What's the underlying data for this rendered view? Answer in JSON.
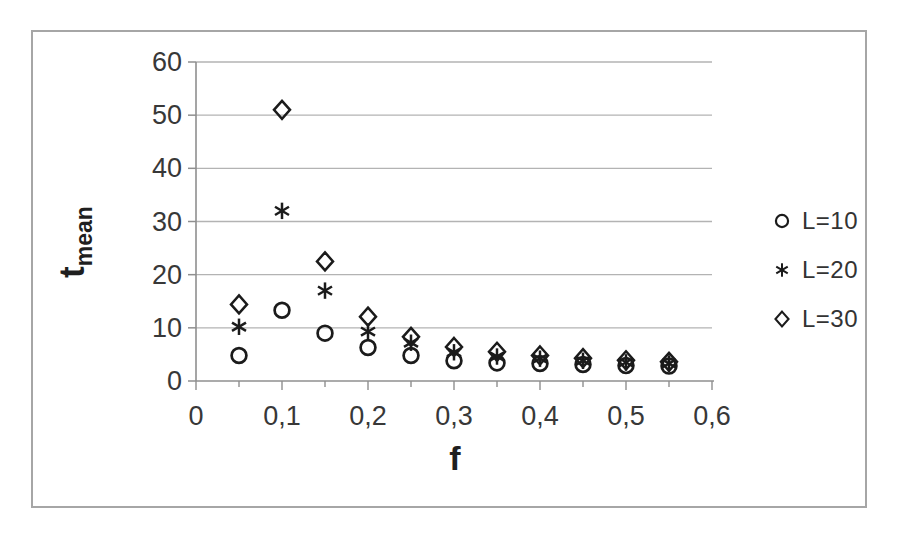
{
  "figure": {
    "background": "#ffffff",
    "border_color": "#a6a6a6"
  },
  "chart_data": {
    "type": "scatter",
    "title": "",
    "xlabel": "f",
    "ylabel": "t",
    "ylabel_subscript": "mean",
    "xlim": [
      0,
      0.6
    ],
    "ylim": [
      0,
      60
    ],
    "grid": "horizontal-only",
    "legend_position": "right",
    "decimal_separator": ",",
    "x_tick_values": [
      0,
      0.1,
      0.2,
      0.3,
      0.4,
      0.5,
      0.6
    ],
    "x_tick_labels": [
      "0",
      "0,1",
      "0,2",
      "0,3",
      "0,4",
      "0,5",
      "0,6"
    ],
    "x_minor_tick_step": 0.05,
    "y_tick_values": [
      0,
      10,
      20,
      30,
      40,
      50,
      60
    ],
    "y_tick_labels": [
      "0",
      "10",
      "20",
      "30",
      "40",
      "50",
      "60"
    ],
    "x": [
      0.05,
      0.1,
      0.15,
      0.2,
      0.25,
      0.3,
      0.35,
      0.4,
      0.45,
      0.5,
      0.55
    ],
    "series": [
      {
        "name": "L=10",
        "marker": "circle",
        "values": [
          4.8,
          13.3,
          9.0,
          6.3,
          4.8,
          3.8,
          3.4,
          3.3,
          3.1,
          2.9,
          2.8
        ]
      },
      {
        "name": "L=20",
        "marker": "asterisk",
        "values": [
          10.2,
          32.0,
          17.0,
          9.3,
          7.2,
          5.4,
          4.6,
          4.2,
          3.8,
          3.5,
          3.3
        ]
      },
      {
        "name": "L=30",
        "marker": "diamond",
        "values": [
          14.4,
          51.0,
          22.5,
          12.1,
          8.3,
          6.4,
          5.5,
          4.8,
          4.3,
          3.9,
          3.6
        ]
      }
    ],
    "colors": {
      "marker": "#1b1b1b",
      "grid": "#b3b3b3",
      "axis": "#8f8f8f",
      "text": "#383838",
      "title_text": "#1f1f1f"
    }
  }
}
